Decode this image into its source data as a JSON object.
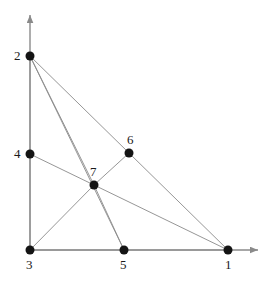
{
  "figure": {
    "background_color": "#ffffff",
    "edge_color": "#8a8a8a",
    "axis_color": "#8a8a8a",
    "node_color": "#141414",
    "label_color": "#1a1a1a",
    "node_radius_px": 4.5,
    "edge_width_px": 0.9,
    "axis_width_px": 1.4
  },
  "axes": {
    "origin": {
      "x": 30,
      "y": 250
    },
    "x_axis": {
      "from_x": 30,
      "from_y": 250,
      "to_x": 258,
      "to_y": 250,
      "arrow": true
    },
    "y_axis": {
      "from_x": 30,
      "from_y": 250,
      "to_x": 30,
      "to_y": 15,
      "arrow": true
    }
  },
  "nodes": [
    {
      "id": "1",
      "label": "1",
      "x": 228,
      "y": 250,
      "label_x": 225,
      "label_y": 258,
      "label_anchor": "below"
    },
    {
      "id": "2",
      "label": "2",
      "x": 30,
      "y": 56,
      "label_x": 14,
      "label_y": 49,
      "label_anchor": "left"
    },
    {
      "id": "3",
      "label": "3",
      "x": 30,
      "y": 250,
      "label_x": 26,
      "label_y": 258,
      "label_anchor": "below"
    },
    {
      "id": "4",
      "label": "4",
      "x": 30,
      "y": 154,
      "label_x": 14,
      "label_y": 147,
      "label_anchor": "left"
    },
    {
      "id": "5",
      "label": "5",
      "x": 124,
      "y": 250,
      "label_x": 120,
      "label_y": 258,
      "label_anchor": "below"
    },
    {
      "id": "6",
      "label": "6",
      "x": 129,
      "y": 153,
      "label_x": 127,
      "label_y": 133,
      "label_anchor": "above"
    },
    {
      "id": "7",
      "label": "7",
      "x": 94,
      "y": 185,
      "label_x": 90,
      "label_y": 165,
      "label_anchor": "above"
    }
  ],
  "edges": [
    {
      "from": "2",
      "to": "4",
      "name": "edge-2-4"
    },
    {
      "from": "4",
      "to": "3",
      "name": "edge-4-3"
    },
    {
      "from": "3",
      "to": "5",
      "name": "edge-3-5"
    },
    {
      "from": "5",
      "to": "1",
      "name": "edge-5-1"
    },
    {
      "from": "2",
      "to": "7",
      "name": "edge-2-7"
    },
    {
      "from": "2",
      "to": "5",
      "name": "edge-2-5"
    },
    {
      "from": "2",
      "to": "6",
      "name": "edge-2-6"
    },
    {
      "from": "6",
      "to": "1",
      "name": "edge-6-1"
    },
    {
      "from": "4",
      "to": "7",
      "name": "edge-4-7"
    },
    {
      "from": "7",
      "to": "6",
      "name": "edge-7-6"
    },
    {
      "from": "7",
      "to": "1",
      "name": "edge-7-1"
    },
    {
      "from": "7",
      "to": "3",
      "name": "edge-7-3"
    },
    {
      "from": "7",
      "to": "5",
      "name": "edge-7-5"
    }
  ],
  "chart_data": {
    "type": "scatter",
    "title": "",
    "xlabel": "",
    "ylabel": "",
    "grid": false,
    "legend": "none",
    "points": [
      {
        "label": "1",
        "x": 228,
        "y": 250
      },
      {
        "label": "2",
        "x": 30,
        "y": 56
      },
      {
        "label": "3",
        "x": 30,
        "y": 250
      },
      {
        "label": "4",
        "x": 30,
        "y": 154
      },
      {
        "label": "5",
        "x": 124,
        "y": 250
      },
      {
        "label": "6",
        "x": 129,
        "y": 153
      },
      {
        "label": "7",
        "x": 94,
        "y": 185
      }
    ],
    "connections": [
      "2-4",
      "4-3",
      "3-5",
      "5-1",
      "2-7",
      "2-5",
      "2-6",
      "6-1",
      "4-7",
      "7-6",
      "7-1",
      "7-3",
      "7-5"
    ]
  }
}
